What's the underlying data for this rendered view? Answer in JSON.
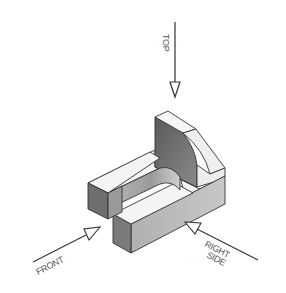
{
  "diagram": {
    "type": "isometric-view-directions",
    "labels": {
      "top": "TOP",
      "front": "FRONT",
      "right_side_line1": "RIGHT",
      "right_side_line2": "SIDE"
    },
    "colors": {
      "background": "#ffffff",
      "line": "#333333",
      "face_light": "#f4f4f4",
      "face_mid": "#a9a9a9",
      "face_dark": "#6e6e6e",
      "label": "#555555"
    }
  }
}
